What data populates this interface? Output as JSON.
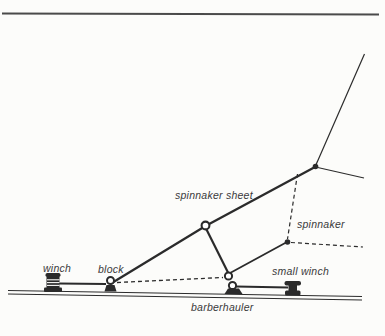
{
  "figure": {
    "type": "diagram",
    "labels": {
      "winch": "winch",
      "block": "block",
      "spinnaker_sheet": "spinnaker sheet",
      "spinnaker": "spinnaker",
      "small_winch": "small winch",
      "barberhauler": "barberhauler"
    },
    "colors": {
      "background": "#fcfcfa",
      "line": "#2b2b2b",
      "top_rule": "#4a4a4a",
      "label_text": "#3a3a3a"
    }
  }
}
